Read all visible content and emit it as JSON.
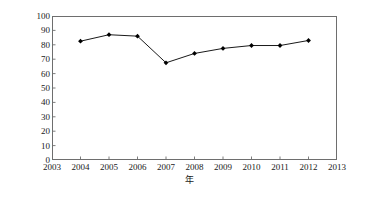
{
  "chart_data": {
    "type": "line",
    "title": "",
    "subtitle": "",
    "xlabel": "年",
    "ylabel": "氮负荷/(kg/hm2)",
    "ylabel_parts": {
      "text": "氮负荷/(kg/hm",
      "sup": "2",
      "tail": ")"
    },
    "x": [
      2004,
      2005,
      2006,
      2007,
      2008,
      2009,
      2010,
      2011,
      2012
    ],
    "values": [
      82.5,
      87.0,
      86.0,
      67.5,
      74.0,
      77.5,
      79.5,
      79.5,
      83.0
    ],
    "series": [
      {
        "name": "氮负荷",
        "x": [
          2004,
          2005,
          2006,
          2007,
          2008,
          2009,
          2010,
          2011,
          2012
        ],
        "values": [
          82.5,
          87.0,
          86.0,
          67.5,
          74.0,
          77.5,
          79.5,
          79.5,
          83.0
        ],
        "line_color": "#1a1a1a",
        "marker": "diamond",
        "marker_color": "#000000"
      }
    ],
    "xlim": [
      2003,
      2013
    ],
    "ylim": [
      0,
      100
    ],
    "xticks": [
      2003,
      2004,
      2005,
      2006,
      2007,
      2008,
      2009,
      2010,
      2011,
      2012,
      2013
    ],
    "yticks": [
      0,
      10,
      20,
      30,
      40,
      50,
      60,
      70,
      80,
      90,
      100
    ],
    "xtick_labels": [
      "2003",
      "2004",
      "2005",
      "2006",
      "2007",
      "2008",
      "2009",
      "2010",
      "2011",
      "2012",
      "2013"
    ],
    "ytick_labels": [
      "0",
      "10",
      "20",
      "30",
      "40",
      "50",
      "60",
      "70",
      "80",
      "90",
      "100"
    ],
    "grid": false,
    "legend": false,
    "legend_position": "none",
    "frame": true,
    "tick_direction": "in",
    "axis_color": "#6e6e6e",
    "background_color": "#ffffff"
  }
}
